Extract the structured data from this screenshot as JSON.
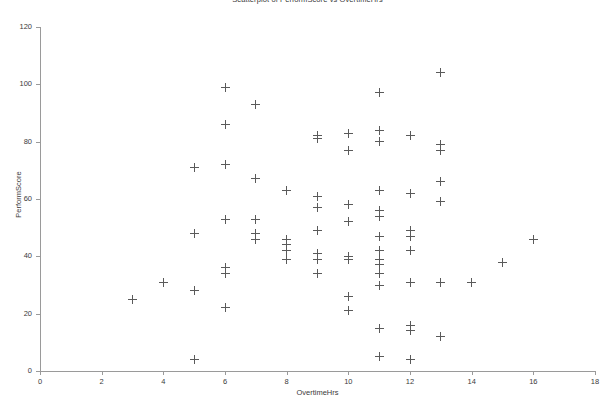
{
  "chart_data": {
    "type": "scatter",
    "title": "Scatterplot of PerformScore vs OvertimeHrs",
    "xlabel": "OvertimeHrs",
    "ylabel": "PerformScore",
    "xlim": [
      0,
      18
    ],
    "ylim": [
      0,
      120
    ],
    "xticks": [
      0,
      2,
      4,
      6,
      8,
      10,
      12,
      14,
      16,
      18
    ],
    "yticks": [
      0,
      20,
      40,
      60,
      80,
      100,
      120
    ],
    "grid": false,
    "legend": null,
    "marker": "plus",
    "marker_color": "#5a5a5a",
    "points": [
      {
        "x": 3,
        "y": 25
      },
      {
        "x": 4,
        "y": 31
      },
      {
        "x": 5,
        "y": 71
      },
      {
        "x": 5,
        "y": 48
      },
      {
        "x": 5,
        "y": 28
      },
      {
        "x": 5,
        "y": 4
      },
      {
        "x": 6,
        "y": 99
      },
      {
        "x": 6,
        "y": 86
      },
      {
        "x": 6,
        "y": 72
      },
      {
        "x": 6,
        "y": 53
      },
      {
        "x": 6,
        "y": 36
      },
      {
        "x": 6,
        "y": 34
      },
      {
        "x": 6,
        "y": 22
      },
      {
        "x": 7,
        "y": 93
      },
      {
        "x": 7,
        "y": 67
      },
      {
        "x": 7,
        "y": 53
      },
      {
        "x": 7,
        "y": 48
      },
      {
        "x": 7,
        "y": 46
      },
      {
        "x": 8,
        "y": 63
      },
      {
        "x": 8,
        "y": 46
      },
      {
        "x": 8,
        "y": 44
      },
      {
        "x": 8,
        "y": 42
      },
      {
        "x": 8,
        "y": 39
      },
      {
        "x": 9,
        "y": 82
      },
      {
        "x": 9,
        "y": 81
      },
      {
        "x": 9,
        "y": 61
      },
      {
        "x": 9,
        "y": 57
      },
      {
        "x": 9,
        "y": 49
      },
      {
        "x": 9,
        "y": 41
      },
      {
        "x": 9,
        "y": 39
      },
      {
        "x": 9,
        "y": 34
      },
      {
        "x": 10,
        "y": 83
      },
      {
        "x": 10,
        "y": 77
      },
      {
        "x": 10,
        "y": 58
      },
      {
        "x": 10,
        "y": 52
      },
      {
        "x": 10,
        "y": 40
      },
      {
        "x": 10,
        "y": 39
      },
      {
        "x": 10,
        "y": 26
      },
      {
        "x": 10,
        "y": 21
      },
      {
        "x": 11,
        "y": 97
      },
      {
        "x": 11,
        "y": 84
      },
      {
        "x": 11,
        "y": 80
      },
      {
        "x": 11,
        "y": 63
      },
      {
        "x": 11,
        "y": 56
      },
      {
        "x": 11,
        "y": 54
      },
      {
        "x": 11,
        "y": 47
      },
      {
        "x": 11,
        "y": 42
      },
      {
        "x": 11,
        "y": 39
      },
      {
        "x": 11,
        "y": 37
      },
      {
        "x": 11,
        "y": 34
      },
      {
        "x": 11,
        "y": 30
      },
      {
        "x": 11,
        "y": 15
      },
      {
        "x": 11,
        "y": 5
      },
      {
        "x": 12,
        "y": 82
      },
      {
        "x": 12,
        "y": 62
      },
      {
        "x": 12,
        "y": 49
      },
      {
        "x": 12,
        "y": 47
      },
      {
        "x": 12,
        "y": 42
      },
      {
        "x": 12,
        "y": 31
      },
      {
        "x": 12,
        "y": 16
      },
      {
        "x": 12,
        "y": 14
      },
      {
        "x": 12,
        "y": 4
      },
      {
        "x": 13,
        "y": 104
      },
      {
        "x": 13,
        "y": 79
      },
      {
        "x": 13,
        "y": 77
      },
      {
        "x": 13,
        "y": 66
      },
      {
        "x": 13,
        "y": 59
      },
      {
        "x": 13,
        "y": 31
      },
      {
        "x": 13,
        "y": 12
      },
      {
        "x": 14,
        "y": 31
      },
      {
        "x": 15,
        "y": 38
      },
      {
        "x": 16,
        "y": 46
      }
    ]
  }
}
